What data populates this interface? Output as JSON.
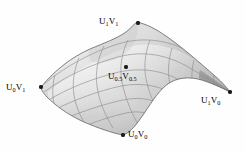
{
  "figure": {
    "kind": "parametric-surface-patch",
    "background_color": "#fefefe",
    "surface_fill_light": "#e9e9e9",
    "surface_fill_mid": "#cfcfcf",
    "surface_fill_dark": "#9d9d9d",
    "grid_line_color": "#8a8a8a",
    "outline_color": "#6f6f6f",
    "marker_color": "#1a1a1a",
    "label_color": "#000000"
  },
  "points": [
    {
      "id": "u1v1",
      "label_main_1": "U",
      "label_sub_1": "1",
      "label_main_2": "V",
      "label_sub_2": "1",
      "label_text": "U1V1",
      "u": 1,
      "v": 1,
      "marker": "filled-dot",
      "position": {
        "x": 137,
        "y": 22
      },
      "label_position": {
        "x": 99,
        "y": 17
      }
    },
    {
      "id": "u0v1",
      "label_main_1": "U",
      "label_sub_1": "0",
      "label_main_2": "V",
      "label_sub_2": "1",
      "label_text": "U0V1",
      "u": 0,
      "v": 1,
      "marker": "filled-dot",
      "position": {
        "x": 41,
        "y": 87
      },
      "label_position": {
        "x": 6,
        "y": 83
      }
    },
    {
      "id": "u05v05",
      "label_main_1": "U",
      "label_sub_1": "0.5",
      "label_main_2": "V",
      "label_sub_2": "0.5",
      "label_text": "U0.5V0.5",
      "u": 0.5,
      "v": 0.5,
      "marker": "filled-dot",
      "position": {
        "x": 126,
        "y": 67
      },
      "label_position": {
        "x": 108,
        "y": 72
      }
    },
    {
      "id": "u1v0",
      "label_main_1": "U",
      "label_sub_1": "1",
      "label_main_2": "V",
      "label_sub_2": "0",
      "label_text": "U1V0",
      "u": 1,
      "v": 0,
      "marker": "filled-dot",
      "position": {
        "x": 230,
        "y": 92
      },
      "label_position": {
        "x": 201,
        "y": 96
      }
    },
    {
      "id": "u0v0",
      "label_main_1": "U",
      "label_sub_1": "0",
      "label_main_2": "V",
      "label_sub_2": "0",
      "label_text": "U0V0",
      "u": 0,
      "v": 0,
      "marker": "filled-dot",
      "position": {
        "x": 123,
        "y": 135
      },
      "label_position": {
        "x": 128,
        "y": 130
      }
    }
  ]
}
